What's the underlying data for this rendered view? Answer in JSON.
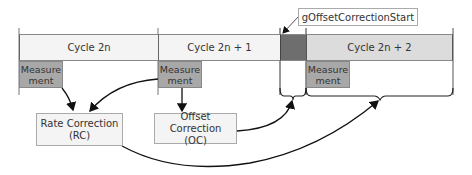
{
  "diagram": {
    "cycles": [
      {
        "label": "Cycle 2n"
      },
      {
        "label": "Cycle 2n + 1"
      },
      {
        "label": "Cycle 2n + 2"
      }
    ],
    "measurement_label_line1": "Measure",
    "measurement_label_line2": "ment",
    "rate_correction": {
      "line1": "Rate Correction",
      "line2": "(RC)"
    },
    "offset_correction": {
      "line1": "Offset Correction",
      "line2": "(OC)"
    },
    "callout": "gOffsetCorrectionStart",
    "colors": {
      "cycle_light": "#f4f4f4",
      "cycle_2n2": "#dcdcdc",
      "offset_segment": "#6e6e6e",
      "measurement": "#a8a8a8"
    }
  }
}
